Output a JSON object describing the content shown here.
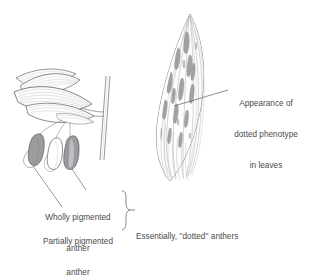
{
  "figure": {
    "background_color": "#ffffff",
    "ink_color": "#4a4a4a",
    "pigment_fill_color": "#9a9c9e",
    "pigment_stroke_color": "#6f7275",
    "vein_color": "#b9bcbe",
    "outline_color": "#55585b"
  },
  "annotations": {
    "leaf_phenotype": {
      "line1": "Appearance of",
      "line2": "dotted phenotype",
      "line3": "in leaves"
    },
    "wholly_pigmented": {
      "line1": "Wholly pigmented",
      "line2": "anther"
    },
    "partially_pigmented": {
      "line1": "Partially pigmented",
      "line2": "anther"
    },
    "essentially_dotted": {
      "text": "Essentially, ''dotted'' anthers"
    }
  },
  "parts": {
    "flower_sprig": "flower-sprig-with-anthers",
    "leaf_blade": "dotted-leaf-blade",
    "anther_wholly_pigmented": "anther-left-pigmented",
    "anther_unpigmented": "anther-middle-unpigmented",
    "anther_partially_pigmented": "anther-right-partially-pigmented",
    "brace": "curly-brace-grouping-anther-labels",
    "leader_lines": "callout-leader-lines"
  }
}
